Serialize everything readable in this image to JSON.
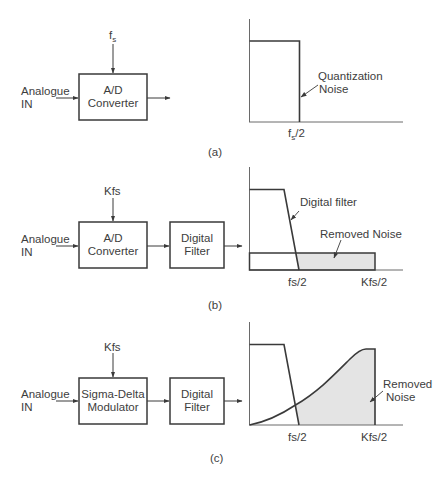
{
  "figure": {
    "panels": [
      {
        "id": "a",
        "caption": "(a)",
        "clock_label": "f",
        "clock_sub": "s",
        "input_label_line1": "Analogue",
        "input_label_line2": "IN",
        "blocks": [
          {
            "line1": "A/D",
            "line2": "Converter"
          }
        ],
        "spectrum": {
          "annotation_line1": "Quantization",
          "annotation_line2": "Noise",
          "tick_main": "f",
          "tick_sub": "s",
          "tick_suffix": "/2"
        }
      },
      {
        "id": "b",
        "caption": "(b)",
        "clock_label": "Kfs",
        "input_label_line1": "Analogue",
        "input_label_line2": "IN",
        "blocks": [
          {
            "line1": "A/D",
            "line2": "Converter"
          },
          {
            "line1": "Digital",
            "line2": "Filter"
          }
        ],
        "spectrum": {
          "filter_label": "Digital filter",
          "noise_label": "Removed Noise",
          "ticks": [
            "fs/2",
            "Kfs/2"
          ]
        }
      },
      {
        "id": "c",
        "caption": "(c)",
        "clock_label": "Kfs",
        "input_label_line1": "Analogue",
        "input_label_line2": "IN",
        "blocks": [
          {
            "line1": "Sigma-Delta",
            "line2": "Modulator"
          },
          {
            "line1": "Digital",
            "line2": "Filter"
          }
        ],
        "spectrum": {
          "noise_label_line1": "Removed",
          "noise_label_line2": "Noise",
          "ticks": [
            "fs/2",
            "Kfs/2"
          ]
        }
      }
    ],
    "colors": {
      "line": "#3a3a3a",
      "shade": "#e4e4e4",
      "axis": "#6a6a6a"
    }
  }
}
